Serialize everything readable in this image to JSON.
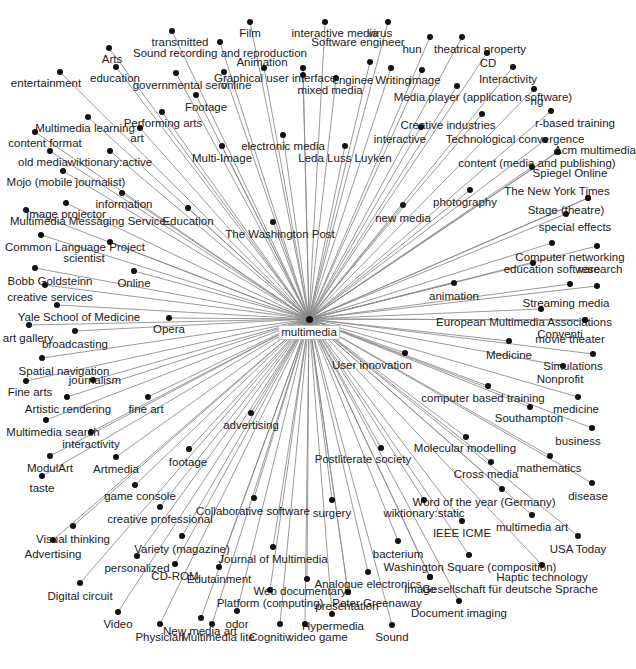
{
  "diagram": {
    "type": "radial-network",
    "title": "",
    "center": {
      "id": "multimedia",
      "label": "multimedia",
      "x": 309,
      "y": 319,
      "lx": 309,
      "ly": 325
    },
    "edge_color": "#8a8a8a",
    "node_color": "#111111",
    "nodes": [
      {
        "label": "Film",
        "x": 250,
        "y": 22,
        "lx": 250,
        "ly": 27
      },
      {
        "label": "interactive media",
        "x": 325,
        "y": 22,
        "lx": 335,
        "ly": 27
      },
      {
        "label": "virus",
        "x": 388,
        "y": 22,
        "lx": 380,
        "ly": 27
      },
      {
        "label": "transmitted",
        "x": 172,
        "y": 31,
        "lx": 180,
        "ly": 36
      },
      {
        "label": "Software engineer",
        "x": 370,
        "y": 62,
        "lx": 358,
        "ly": 36
      },
      {
        "label": "Sound recording and reproduction",
        "x": 220,
        "y": 42,
        "lx": 220,
        "ly": 47
      },
      {
        "label": "hun",
        "x": 430,
        "y": 37,
        "lx": 412,
        "ly": 43
      },
      {
        "label": "theatrical property",
        "x": 462,
        "y": 37,
        "lx": 480,
        "ly": 43
      },
      {
        "label": "CD",
        "x": 487,
        "y": 53,
        "lx": 488,
        "ly": 57
      },
      {
        "label": "Arts",
        "x": 109,
        "y": 48,
        "lx": 112,
        "ly": 53
      },
      {
        "label": "Animation",
        "x": 264,
        "y": 68,
        "lx": 262,
        "ly": 56
      },
      {
        "label": "Interactivity",
        "x": 513,
        "y": 67,
        "lx": 508,
        "ly": 73
      },
      {
        "label": "entertainment",
        "x": 60,
        "y": 72,
        "lx": 46,
        "ly": 77
      },
      {
        "label": "education",
        "x": 116,
        "y": 67,
        "lx": 115,
        "ly": 72
      },
      {
        "label": "governmental serv",
        "x": 176,
        "y": 73,
        "lx": 180,
        "ly": 79
      },
      {
        "label": "online",
        "x": 224,
        "y": 72,
        "lx": 236,
        "ly": 79
      },
      {
        "label": "Graphical user interface",
        "x": 303,
        "y": 68,
        "lx": 275,
        "ly": 72
      },
      {
        "label": "enginee",
        "x": 336,
        "y": 78,
        "lx": 353,
        "ly": 74
      },
      {
        "label": "Writing",
        "x": 391,
        "y": 68,
        "lx": 393,
        "ly": 74
      },
      {
        "label": "image",
        "x": 422,
        "y": 70,
        "lx": 425,
        "ly": 74
      },
      {
        "label": "mixed media",
        "x": 303,
        "y": 75,
        "lx": 330,
        "ly": 84
      },
      {
        "label": "Media player (application software)",
        "x": 457,
        "y": 86,
        "lx": 483,
        "ly": 91
      },
      {
        "label": "ng",
        "x": 534,
        "y": 89,
        "lx": 537,
        "ly": 95
      },
      {
        "label": "Footage",
        "x": 196,
        "y": 95,
        "lx": 206,
        "ly": 101
      },
      {
        "label": "Performing arts",
        "x": 162,
        "y": 112,
        "lx": 163,
        "ly": 117
      },
      {
        "label": "art",
        "x": 140,
        "y": 128,
        "lx": 137,
        "ly": 132
      },
      {
        "label": "Multimedia learning",
        "x": 88,
        "y": 117,
        "lx": 85,
        "ly": 122
      },
      {
        "label": "Creative industries",
        "x": 482,
        "y": 114,
        "lx": 448,
        "ly": 119
      },
      {
        "label": "r-based training",
        "x": 551,
        "y": 111,
        "lx": 575,
        "ly": 117
      },
      {
        "label": "content format",
        "x": 35,
        "y": 132,
        "lx": 45,
        "ly": 137
      },
      {
        "label": "electronic media",
        "x": 283,
        "y": 135,
        "lx": 283,
        "ly": 140
      },
      {
        "label": "interactive",
        "x": 421,
        "y": 127,
        "lx": 400,
        "ly": 133
      },
      {
        "label": "Technological convergence",
        "x": 545,
        "y": 140,
        "lx": 515,
        "ly": 133
      },
      {
        "label": "Acm multimedia",
        "x": 557,
        "y": 152,
        "lx": 595,
        "ly": 144
      },
      {
        "label": "old media",
        "x": 50,
        "y": 151,
        "lx": 43,
        "ly": 156
      },
      {
        "label": "wiktionary:active",
        "x": 110,
        "y": 151,
        "lx": 110,
        "ly": 156
      },
      {
        "label": "Multi-Image",
        "x": 222,
        "y": 146,
        "lx": 222,
        "ly": 152
      },
      {
        "label": "Leda Luss Luyken",
        "x": 345,
        "y": 146,
        "lx": 345,
        "ly": 152
      },
      {
        "label": "content (media and publishing)",
        "x": 558,
        "y": 152,
        "lx": 537,
        "ly": 157
      },
      {
        "label": "Mojo (mobile journalist)",
        "x": 63,
        "y": 171,
        "lx": 66,
        "ly": 176
      },
      {
        "label": "Spiegel Online",
        "x": 532,
        "y": 167,
        "lx": 570,
        "ly": 167
      },
      {
        "label": "The New York Times",
        "x": 588,
        "y": 198,
        "lx": 557,
        "ly": 185
      },
      {
        "label": "photography",
        "x": 470,
        "y": 190,
        "lx": 465,
        "ly": 196
      },
      {
        "label": "information",
        "x": 122,
        "y": 193,
        "lx": 124,
        "ly": 198
      },
      {
        "label": "Image projector",
        "x": 66,
        "y": 203,
        "lx": 66,
        "ly": 208
      },
      {
        "label": "Multimedia Messaging Service",
        "x": 26,
        "y": 210,
        "lx": 88,
        "ly": 215
      },
      {
        "label": "Education",
        "x": 188,
        "y": 208,
        "lx": 188,
        "ly": 215
      },
      {
        "label": "Stage (theatre)",
        "x": 588,
        "y": 198,
        "lx": 566,
        "ly": 204
      },
      {
        "label": "new media",
        "x": 403,
        "y": 205,
        "lx": 403,
        "ly": 212
      },
      {
        "label": "The Washington Post",
        "x": 273,
        "y": 222,
        "lx": 280,
        "ly": 228
      },
      {
        "label": "special effects",
        "x": 566,
        "y": 214,
        "lx": 575,
        "ly": 221
      },
      {
        "label": "Common Language Project",
        "x": 41,
        "y": 235,
        "lx": 75,
        "ly": 241
      },
      {
        "label": "scientist",
        "x": 110,
        "y": 242,
        "lx": 84,
        "ly": 252
      },
      {
        "label": "Computer networking",
        "x": 552,
        "y": 243,
        "lx": 570,
        "ly": 251
      },
      {
        "label": "research",
        "x": 597,
        "y": 246,
        "lx": 600,
        "ly": 263
      },
      {
        "label": "education software",
        "x": 533,
        "y": 263,
        "lx": 552,
        "ly": 263
      },
      {
        "label": "Bobb Goldsteinn",
        "x": 35,
        "y": 268,
        "lx": 50,
        "ly": 275
      },
      {
        "label": "Online",
        "x": 134,
        "y": 271,
        "lx": 134,
        "ly": 277
      },
      {
        "label": "creative services",
        "x": 45,
        "y": 285,
        "lx": 50,
        "ly": 291
      },
      {
        "label": "animation",
        "x": 454,
        "y": 283,
        "lx": 454,
        "ly": 290
      },
      {
        "label": "Streaming media",
        "x": 570,
        "y": 284,
        "lx": 566,
        "ly": 297
      },
      {
        "label": "Streaming target",
        "x": 597,
        "y": 286,
        "lx": 0,
        "ly": 0,
        "hide_label": true
      },
      {
        "label": "Yale School of Medicine",
        "x": 57,
        "y": 305,
        "lx": 79,
        "ly": 311
      },
      {
        "label": "European Multimedia Associations",
        "x": 541,
        "y": 309,
        "lx": 524,
        "ly": 316
      },
      {
        "label": "Opera",
        "x": 169,
        "y": 318,
        "lx": 169,
        "ly": 323
      },
      {
        "label": "art gallery",
        "x": 29,
        "y": 325,
        "lx": 28,
        "ly": 332
      },
      {
        "label": "broadcasting",
        "x": 75,
        "y": 331,
        "lx": 75,
        "ly": 338
      },
      {
        "label": "Conventi",
        "x": 585,
        "y": 320,
        "lx": 560,
        "ly": 328
      },
      {
        "label": "movie theater",
        "x": 585,
        "y": 320,
        "lx": 570,
        "ly": 333
      },
      {
        "label": "Medicine",
        "x": 509,
        "y": 341,
        "lx": 509,
        "ly": 349
      },
      {
        "label": "User innovation",
        "x": 405,
        "y": 353,
        "lx": 372,
        "ly": 359
      },
      {
        "label": "Simulations",
        "x": 593,
        "y": 354,
        "lx": 573,
        "ly": 360
      },
      {
        "label": "Spatial navigation",
        "x": 42,
        "y": 358,
        "lx": 64,
        "ly": 365
      },
      {
        "label": "Nonprofit",
        "x": 563,
        "y": 366,
        "lx": 560,
        "ly": 373
      },
      {
        "label": "journalism",
        "x": 93,
        "y": 380,
        "lx": 95,
        "ly": 374
      },
      {
        "label": "Fine arts",
        "x": 26,
        "y": 381,
        "lx": 30,
        "ly": 386
      },
      {
        "label": "computer based training",
        "x": 488,
        "y": 386,
        "lx": 483,
        "ly": 392
      },
      {
        "label": "Artistic rendering",
        "x": 67,
        "y": 397,
        "lx": 68,
        "ly": 403
      },
      {
        "label": "fine art",
        "x": 148,
        "y": 397,
        "lx": 146,
        "ly": 403
      },
      {
        "label": "medicine",
        "x": 578,
        "y": 397,
        "lx": 576,
        "ly": 403
      },
      {
        "label": "Southampton",
        "x": 530,
        "y": 407,
        "lx": 529,
        "ly": 412
      },
      {
        "label": "advertising",
        "x": 251,
        "y": 413,
        "lx": 251,
        "ly": 419
      },
      {
        "label": "Multimedia search",
        "x": 46,
        "y": 420,
        "lx": 53,
        "ly": 426
      },
      {
        "label": "business",
        "x": 592,
        "y": 428,
        "lx": 578,
        "ly": 435
      },
      {
        "label": "interactivity",
        "x": 91,
        "y": 432,
        "lx": 91,
        "ly": 438
      },
      {
        "label": "Molecular modelling",
        "x": 466,
        "y": 437,
        "lx": 465,
        "ly": 442
      },
      {
        "label": "Postliterate society",
        "x": 381,
        "y": 448,
        "lx": 363,
        "ly": 453
      },
      {
        "label": "footage",
        "x": 189,
        "y": 449,
        "lx": 188,
        "ly": 456
      },
      {
        "label": "mathematics",
        "x": 550,
        "y": 456,
        "lx": 549,
        "ly": 462
      },
      {
        "label": "ModulArt",
        "x": 50,
        "y": 456,
        "lx": 50,
        "ly": 462
      },
      {
        "label": "Artmedia",
        "x": 116,
        "y": 457,
        "lx": 116,
        "ly": 463
      },
      {
        "label": "Cross media",
        "x": 491,
        "y": 462,
        "lx": 486,
        "ly": 468
      },
      {
        "label": "taste",
        "x": 42,
        "y": 476,
        "lx": 42,
        "ly": 482
      },
      {
        "label": "disease",
        "x": 592,
        "y": 483,
        "lx": 588,
        "ly": 490
      },
      {
        "label": "game console",
        "x": 135,
        "y": 485,
        "lx": 140,
        "ly": 490
      },
      {
        "label": "Word of the year (Germany)",
        "x": 502,
        "y": 489,
        "lx": 484,
        "ly": 496
      },
      {
        "label": "Collaborative software",
        "x": 254,
        "y": 498,
        "lx": 253,
        "ly": 505
      },
      {
        "label": "surgery",
        "x": 332,
        "y": 500,
        "lx": 332,
        "ly": 507
      },
      {
        "label": "wiktionary:static",
        "x": 424,
        "y": 500,
        "lx": 424,
        "ly": 507
      },
      {
        "label": "creative professional",
        "x": 160,
        "y": 507,
        "lx": 160,
        "ly": 513
      },
      {
        "label": "multimedia art",
        "x": 532,
        "y": 515,
        "lx": 532,
        "ly": 521
      },
      {
        "label": "IEEE ICME",
        "x": 462,
        "y": 521,
        "lx": 462,
        "ly": 527
      },
      {
        "label": "Visual thinking",
        "x": 73,
        "y": 526,
        "lx": 73,
        "ly": 533
      },
      {
        "label": "USA Today",
        "x": 578,
        "y": 536,
        "lx": 578,
        "ly": 543
      },
      {
        "label": "bacterium",
        "x": 398,
        "y": 541,
        "lx": 398,
        "ly": 548
      },
      {
        "label": "Variety (magazine)",
        "x": 182,
        "y": 536,
        "lx": 182,
        "ly": 543
      },
      {
        "label": "Advertising",
        "x": 53,
        "y": 540,
        "lx": 53,
        "ly": 548
      },
      {
        "label": "Journal of Multimedia",
        "x": 273,
        "y": 547,
        "lx": 273,
        "ly": 553
      },
      {
        "label": "Washington Square (composition)",
        "x": 469,
        "y": 555,
        "lx": 470,
        "ly": 561
      },
      {
        "label": "personalized",
        "x": 137,
        "y": 556,
        "lx": 137,
        "ly": 562
      },
      {
        "label": "CD-ROM",
        "x": 175,
        "y": 564,
        "lx": 175,
        "ly": 570
      },
      {
        "label": "Haptic technology",
        "x": 542,
        "y": 565,
        "lx": 542,
        "ly": 571
      },
      {
        "label": "Edutainment",
        "x": 219,
        "y": 567,
        "lx": 219,
        "ly": 573
      },
      {
        "label": "Analogue electronics",
        "x": 368,
        "y": 572,
        "lx": 368,
        "ly": 578
      },
      {
        "label": "Image",
        "x": 430,
        "y": 577,
        "lx": 420,
        "ly": 583
      },
      {
        "label": "Gesellschaft für deutsche Sprache",
        "x": 430,
        "y": 577,
        "lx": 510,
        "ly": 583
      },
      {
        "label": "Web documentary",
        "x": 307,
        "y": 579,
        "lx": 300,
        "ly": 585
      },
      {
        "label": "Digital circuit",
        "x": 80,
        "y": 583,
        "lx": 80,
        "ly": 590
      },
      {
        "label": "Peter Greenaway",
        "x": 348,
        "y": 592,
        "lx": 377,
        "ly": 597
      },
      {
        "label": "Platform (computing)",
        "x": 270,
        "y": 590,
        "lx": 270,
        "ly": 597
      },
      {
        "label": "presentation",
        "x": 348,
        "y": 592,
        "lx": 347,
        "ly": 600
      },
      {
        "label": "Document imaging",
        "x": 459,
        "y": 601,
        "lx": 459,
        "ly": 607
      },
      {
        "label": "Video",
        "x": 118,
        "y": 612,
        "lx": 118,
        "ly": 618
      },
      {
        "label": "odor",
        "x": 237,
        "y": 611,
        "lx": 237,
        "ly": 618
      },
      {
        "label": "Hypermedia",
        "x": 332,
        "y": 614,
        "lx": 333,
        "ly": 620
      },
      {
        "label": "New media art",
        "x": 201,
        "y": 618,
        "lx": 200,
        "ly": 625
      },
      {
        "label": "Sound",
        "x": 392,
        "y": 625,
        "lx": 392,
        "ly": 631
      },
      {
        "label": "Physician",
        "x": 160,
        "y": 624,
        "lx": 160,
        "ly": 631
      },
      {
        "label": "Multimedia lite",
        "x": 212,
        "y": 624,
        "lx": 218,
        "ly": 631
      },
      {
        "label": "Cognitiv",
        "x": 280,
        "y": 624,
        "lx": 270,
        "ly": 631
      },
      {
        "label": "video game",
        "x": 305,
        "y": 624,
        "lx": 318,
        "ly": 631
      }
    ]
  }
}
